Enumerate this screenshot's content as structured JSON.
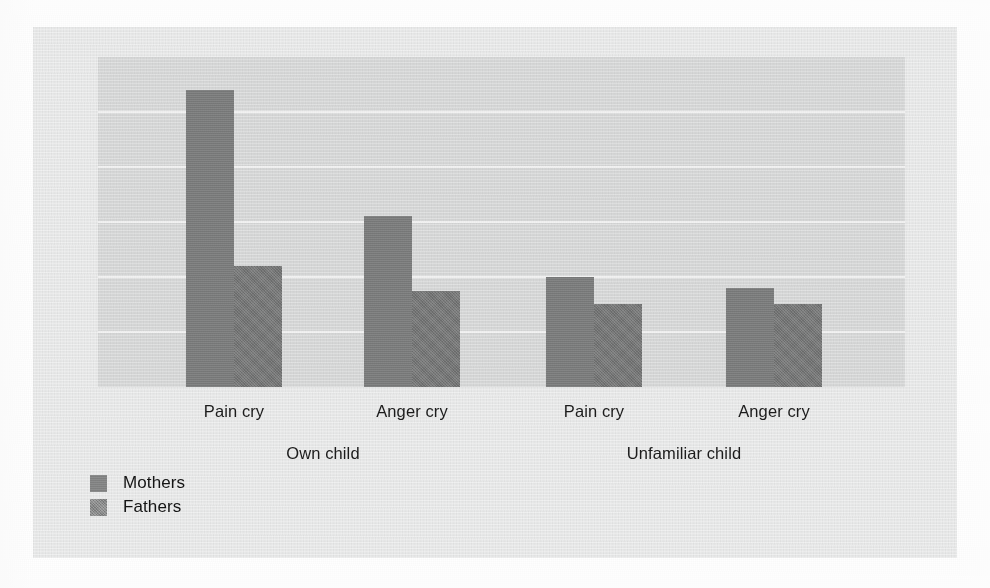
{
  "figure": {
    "background_color": "#e9eaea",
    "plot_background_color": "#d7d8d8",
    "gridline_color": "#f4f4f4"
  },
  "legend": {
    "position": "bottom-left",
    "entries": [
      {
        "label": "Mothers",
        "color": "#7e7f7f",
        "swatch": "legend-swatch-mothers"
      },
      {
        "label": "Fathers",
        "color": "#767777",
        "swatch": "legend-swatch-fathers"
      }
    ]
  },
  "axis": {
    "category_labels": [
      "Pain cry",
      "Anger cry",
      "Pain cry",
      "Anger cry"
    ],
    "group_labels": [
      "Own child",
      "Unfamiliar child"
    ]
  },
  "chart_data": {
    "type": "bar",
    "title": "",
    "subtitle": "",
    "xlabel": "",
    "ylabel": "",
    "grid": true,
    "legend_position": "bottom-left",
    "ylim": [
      0,
      6
    ],
    "y_gridlines": [
      1,
      2,
      3,
      4,
      5,
      6
    ],
    "ytick_labels": [],
    "groups": [
      "Own child",
      "Unfamiliar child"
    ],
    "categories": [
      "Pain cry",
      "Anger cry",
      "Pain cry",
      "Anger cry"
    ],
    "category_group": [
      "Own child",
      "Own child",
      "Unfamiliar child",
      "Unfamiliar child"
    ],
    "series": [
      {
        "name": "Mothers",
        "color": "#7e7f7f",
        "values": [
          5.4,
          3.1,
          2.0,
          1.8
        ]
      },
      {
        "name": "Fathers",
        "color": "#767777",
        "values": [
          2.2,
          1.75,
          1.5,
          1.5
        ]
      }
    ]
  }
}
